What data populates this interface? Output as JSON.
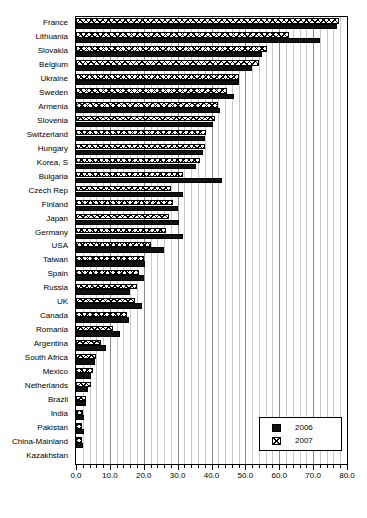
{
  "chart_data": {
    "type": "bar",
    "orientation": "horizontal",
    "title": "",
    "xlabel": "",
    "ylabel": "",
    "xlim": [
      0.0,
      80.0
    ],
    "xticks": [
      "0.0",
      "10.0",
      "20.0",
      "30.0",
      "40.0",
      "50.0",
      "60.0",
      "70.0",
      "80.0"
    ],
    "xtick_values": [
      0,
      10,
      20,
      30,
      40,
      50,
      60,
      70,
      80
    ],
    "minor_tick_step": 2,
    "grid": true,
    "legend_position": "bottom-right",
    "categories": [
      "France",
      "Lithuania",
      "Slovakia",
      "Belgium",
      "Ukraine",
      "Sweden",
      "Armenia",
      "Slovenia",
      "Switzerland",
      "Hungary",
      "Korea, S",
      "Bulgaria",
      "Czech Rep",
      "Finland",
      "Japan",
      "Germany",
      "USA",
      "Taiwan",
      "Spain",
      "Russia",
      "UK",
      "Canada",
      "Romania",
      "Argentina",
      "South Africa",
      "Mexico",
      "Netherlands",
      "Brazil",
      "India",
      "Pakistan",
      "China-Mainland",
      "Kazakhstan"
    ],
    "series": [
      {
        "name": "2006",
        "color": "#111111",
        "pattern": "solid",
        "values": [
          77.0,
          72.0,
          55.0,
          52.0,
          48.0,
          46.5,
          42.5,
          40.5,
          38.0,
          37.5,
          35.5,
          43.0,
          31.5,
          30.0,
          30.5,
          31.5,
          26.0,
          20.5,
          20.0,
          16.0,
          19.5,
          15.5,
          13.0,
          9.0,
          5.5,
          4.5,
          3.5,
          3.0,
          2.5,
          2.5,
          2.0,
          0.0
        ]
      },
      {
        "name": "2007",
        "color": "#ffffff",
        "pattern": "crosshatch",
        "values": [
          77.7,
          63.0,
          56.5,
          54.0,
          48.0,
          44.5,
          42.0,
          41.0,
          38.5,
          38.0,
          36.5,
          31.5,
          28.0,
          28.5,
          27.5,
          26.5,
          22.0,
          20.0,
          18.5,
          18.0,
          17.5,
          15.0,
          11.0,
          7.5,
          6.0,
          5.0,
          4.5,
          3.0,
          2.0,
          1.8,
          1.8,
          0.0
        ]
      }
    ],
    "legend": [
      {
        "label": "2006",
        "swatch": "solid-black"
      },
      {
        "label": "2007",
        "swatch": "crosshatch"
      }
    ]
  }
}
